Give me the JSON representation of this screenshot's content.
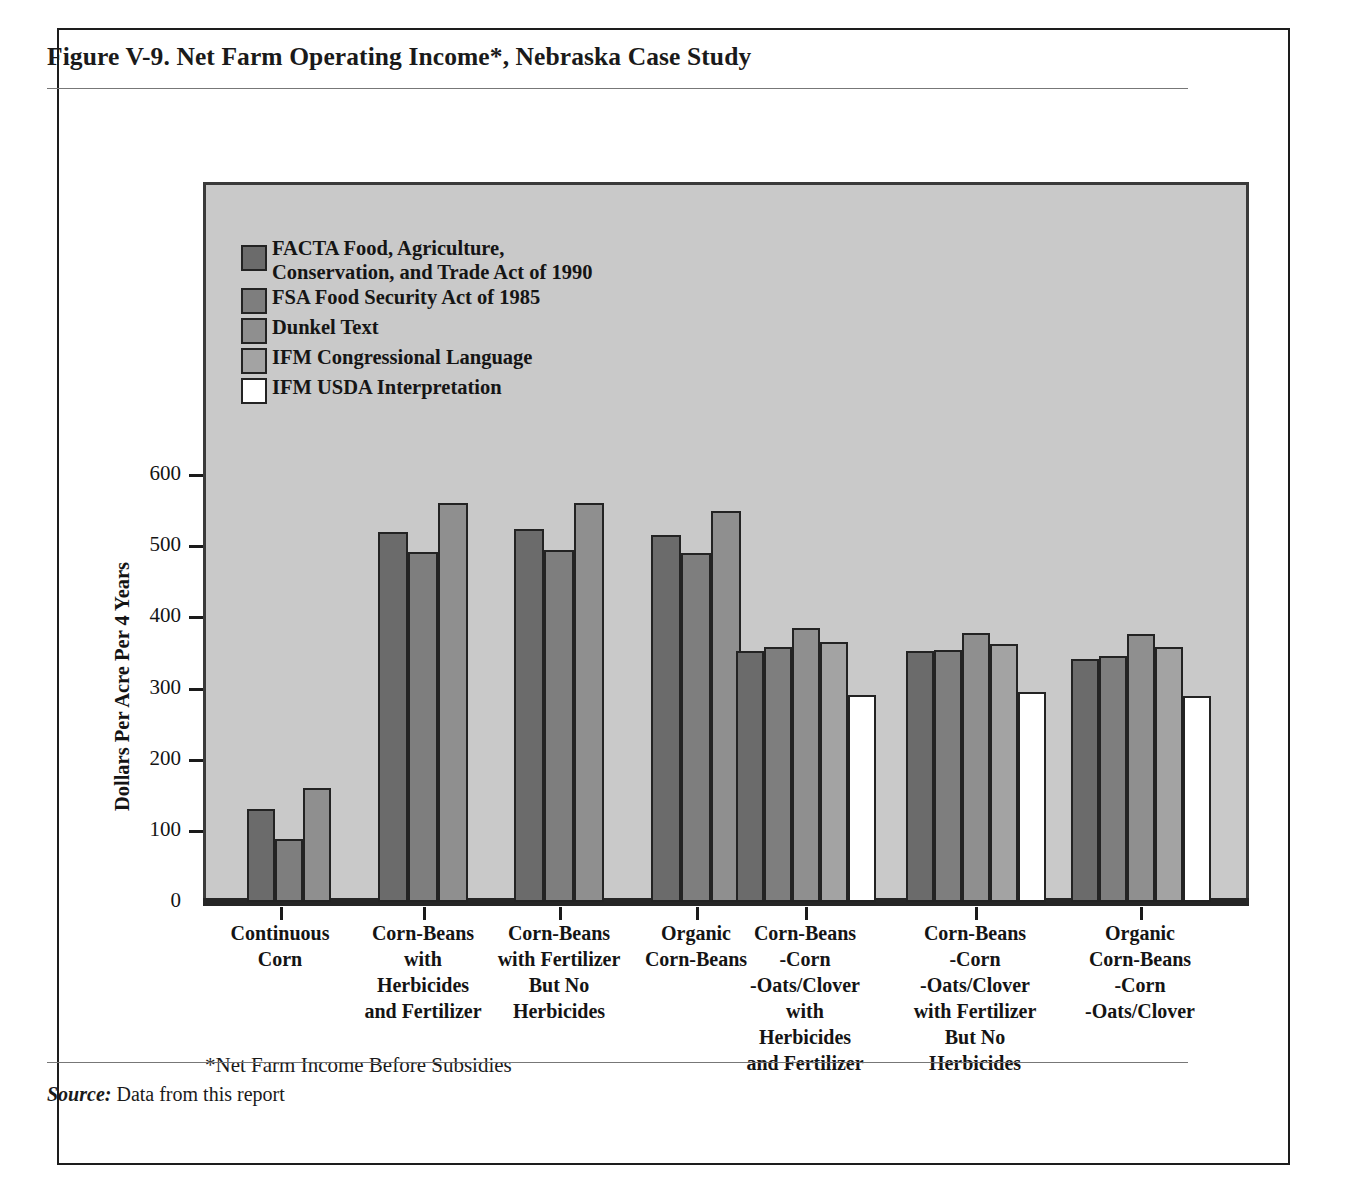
{
  "figure": {
    "title": "Figure V-9.  Net Farm Operating Income*, Nebraska Case Study",
    "footnote": "*Net Farm Income Before Subsidies",
    "source_label": "Source:",
    "source_text": " Data from this report"
  },
  "colors": {
    "plot_background": "#c9c9c9",
    "page_background": "#ffffff",
    "axis": "#232323",
    "text": "#141414",
    "series": [
      "#6b6b6b",
      "#7e7e7e",
      "#8f8f8f",
      "#a3a3a3",
      "#ffffff"
    ]
  },
  "chart_data": {
    "type": "bar",
    "title": "Figure V-9.  Net Farm Operating Income*, Nebraska Case Study",
    "xlabel": "",
    "ylabel": "Dollars Per Acre Per 4 Years",
    "ylim": [
      0,
      640
    ],
    "yticks": [
      0,
      100,
      200,
      300,
      400,
      500,
      600
    ],
    "ytick_labels": [
      "0",
      "100",
      "200",
      "300",
      "400",
      "500",
      "600"
    ],
    "grid": false,
    "legend_position": "upper-left-inside",
    "categories": [
      "Continuous\nCorn",
      "Corn-Beans\nwith\nHerbicides\nand Fertilizer",
      "Corn-Beans\nwith Fertilizer\nBut No\nHerbicides",
      "Organic\nCorn-Beans",
      "Corn-Beans\n-Corn\n-Oats/Clover\nwith\nHerbicides\nand Fertilizer",
      "Corn-Beans\n-Corn\n-Oats/Clover\nwith Fertilizer\nBut No\nHerbicides",
      "Organic\nCorn-Beans\n-Corn\n-Oats/Clover"
    ],
    "series": [
      {
        "name": "FACTA  Food, Agriculture, Conservation, and Trade Act of 1990",
        "short": "FACTA",
        "color": "#6b6b6b",
        "values": [
          130,
          520,
          524,
          515,
          353,
          352,
          341
        ]
      },
      {
        "name": "FSA  Food Security Act of 1985",
        "short": "FSA",
        "color": "#7e7e7e",
        "values": [
          88,
          492,
          494,
          491,
          358,
          354,
          346
        ]
      },
      {
        "name": "Dunkel Text",
        "short": "Dunkel",
        "color": "#8f8f8f",
        "values": [
          160,
          561,
          561,
          549,
          385,
          378,
          376
        ]
      },
      {
        "name": "IFM  Congressional Language",
        "short": "IFM-Congressional",
        "color": "#a3a3a3",
        "values": [
          null,
          null,
          null,
          null,
          366,
          362,
          359
        ]
      },
      {
        "name": "IFM  USDA Interpretation",
        "short": "IFM-USDA",
        "color": "#ffffff",
        "values": [
          null,
          null,
          null,
          null,
          291,
          295,
          289
        ]
      }
    ]
  },
  "legend": {
    "items": [
      {
        "label": "FACTA  Food, Agriculture,\nConservation, and Trade Act of 1990",
        "color": "#6b6b6b"
      },
      {
        "label": "FSA  Food Security Act of 1985",
        "color": "#7e7e7e"
      },
      {
        "label": "Dunkel Text",
        "color": "#8f8f8f"
      },
      {
        "label": "IFM  Congressional Language",
        "color": "#a3a3a3"
      },
      {
        "label": "IFM  USDA Interpretation",
        "color": "#ffffff"
      }
    ]
  }
}
